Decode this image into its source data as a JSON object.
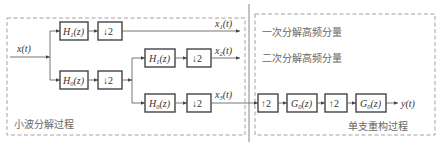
{
  "diagram": {
    "decomposition_label": "小波分解过程",
    "reconstruction_label": "单支重构过程",
    "legend": {
      "first_high": "一次分解高频分量",
      "second_high": "二次分解高频分量"
    },
    "input": {
      "base": "x",
      "arg": "(t)"
    },
    "output": {
      "base": "y",
      "arg": "(t)"
    },
    "level1": {
      "high_filter": {
        "base": "H",
        "sub": "1",
        "arg": "(z)"
      },
      "low_filter": {
        "base": "H",
        "sub": "0",
        "arg": "(z)"
      },
      "downsample": "↓2",
      "output": {
        "base": "x",
        "sub": "1",
        "arg": "(t)"
      }
    },
    "level2": {
      "high_filter": {
        "base": "H",
        "sub": "1",
        "arg": "(z)"
      },
      "low_filter": {
        "base": "H",
        "sub": "0",
        "arg": "(z)"
      },
      "downsample": "↓2",
      "high_output": {
        "base": "x",
        "sub": "2",
        "arg": "(t)"
      },
      "low_output": {
        "base": "x",
        "sub": "3",
        "arg": "(t)"
      }
    },
    "reconstruction": {
      "upsample1": "↑2",
      "filter1": {
        "base": "G",
        "sub": "0",
        "arg": "(z)"
      },
      "upsample2": "↑2",
      "filter2": {
        "base": "G",
        "sub": "0",
        "arg": "(z)"
      }
    }
  }
}
